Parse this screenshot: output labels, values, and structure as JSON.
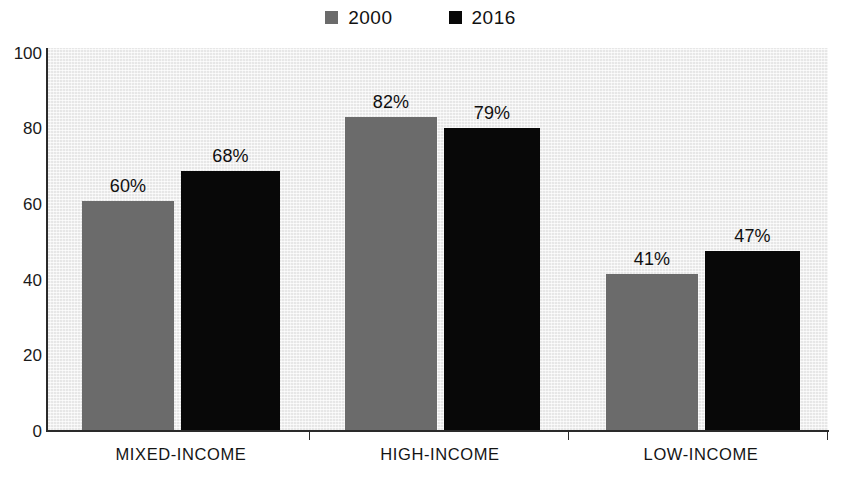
{
  "legend": {
    "position": "top-center",
    "entries": [
      {
        "label": "2000",
        "color": "#6b6b6b",
        "swatch_name": "legend-swatch-2000"
      },
      {
        "label": "2016",
        "color": "#080808",
        "swatch_name": "legend-swatch-2016"
      }
    ]
  },
  "axis": {
    "y_ticks": [
      "100",
      "80",
      "60",
      "40",
      "20",
      "0"
    ],
    "x_categories": [
      "MIXED-INCOME",
      "HIGH-INCOME",
      "LOW-INCOME"
    ]
  },
  "bar_labels": {
    "mixed_2000": "60%",
    "mixed_2016": "68%",
    "high_2000": "82%",
    "high_2016": "79%",
    "low_2000": "41%",
    "low_2016": "47%"
  },
  "chart_data": {
    "type": "bar",
    "title": "",
    "subtitle": "",
    "xlabel": "",
    "ylabel": "",
    "categories": [
      "MIXED-INCOME",
      "HIGH-INCOME",
      "LOW-INCOME"
    ],
    "series": [
      {
        "name": "2000",
        "color": "#6b6b6b",
        "values": [
          60,
          82,
          41
        ],
        "value_labels": [
          "60%",
          "82%",
          "41%"
        ]
      },
      {
        "name": "2016",
        "color": "#080808",
        "values": [
          68,
          79,
          47
        ],
        "value_labels": [
          "68%",
          "79%",
          "47%"
        ]
      }
    ],
    "ylim": [
      0,
      100
    ],
    "yticks": [
      0,
      20,
      40,
      60,
      80,
      100
    ],
    "ytick_labels": [
      "0",
      "20",
      "40",
      "60",
      "80",
      "100"
    ],
    "grid": false,
    "legend_position": "top-center",
    "value_label_suffix": "%",
    "plot_background": "#f1f1f1"
  }
}
